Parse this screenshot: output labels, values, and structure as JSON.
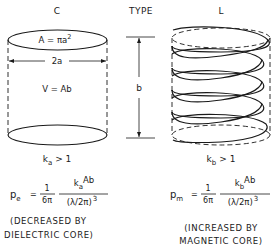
{
  "header": {
    "left_type": "C",
    "center_label": "TYPE",
    "right_type": "L"
  },
  "capacitor": {
    "area_formula": "A = πa²",
    "area_lhs": "A = πa",
    "area_exp": "2",
    "diameter_label": "2a",
    "volume_formula": "V = Ab",
    "k_base": "k",
    "k_sub": "a",
    "k_condition": "> 1",
    "power_p": "p",
    "power_sub": "e",
    "eq_sign": "=",
    "frac1_num": "1",
    "frac1_den": "6π",
    "frac2_num_k": "k",
    "frac2_num_sub": "a",
    "frac2_num_rest": "Ab",
    "frac2_den": "(λ/2π)",
    "frac2_den_exp": "3",
    "note_line1": "(DECREASED BY",
    "note_line2": "DIELECTRIC CORE)"
  },
  "dimension": {
    "height_label": "b"
  },
  "inductor": {
    "k_base": "k",
    "k_sub": "b",
    "k_condition": "> 1",
    "power_p": "p",
    "power_sub": "m",
    "eq_sign": "=",
    "frac1_num": "1",
    "frac1_den": "6π",
    "frac2_num_k": "k",
    "frac2_num_sub": "b",
    "frac2_num_rest": "Ab",
    "frac2_den": "(λ/2π)",
    "frac2_den_exp": "3",
    "note_line1": "(INCREASED BY",
    "note_line2": "MAGNETIC CORE)"
  },
  "colors": {
    "ink": "#1a1a1a",
    "background": "#ffffff"
  }
}
